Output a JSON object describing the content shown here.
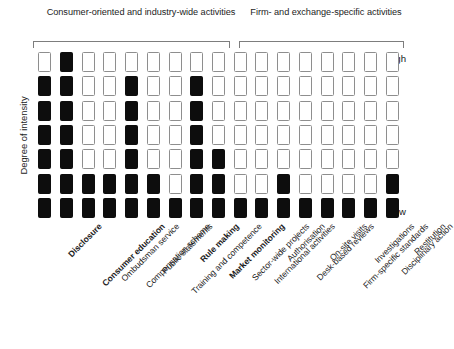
{
  "chart_data": {
    "type": "heatmap",
    "title": "",
    "xlabel": "",
    "ylabel": "Degree of intensity",
    "y_tick_labels": [
      "High",
      "Low"
    ],
    "ylim_labels": {
      "top": "High",
      "bottom": "Low"
    },
    "grid": false,
    "legend": "none",
    "rows": 7,
    "columns": 17,
    "cell_states": [
      "off",
      "on"
    ],
    "colors": {
      "on": "#0d0d0d",
      "off": "#ffffff",
      "cell_border": "#8e8e8e",
      "bracket": "#7d7d7d",
      "text": "#1d1d1d"
    },
    "groups": [
      {
        "label": "Consumer-oriented and industry-wide activities",
        "start_column": 1,
        "end_column": 10
      },
      {
        "label": "Firm- and exchange-specific activities",
        "start_column": 11,
        "end_column": 17
      }
    ],
    "categories": [
      "Disclosure",
      "Consumer education",
      "Ombudsman service",
      "Compensation scheme",
      "Public statements",
      "Training and competence",
      "Rule making",
      "Market monitoring",
      "Sector-wide projects",
      "International activities",
      "Authorisation",
      "Desk-based reviews",
      "On-site visits",
      "Firm-specific standards",
      "Investigations",
      "Disciplinary action",
      "Restitution"
    ],
    "emphasised_categories": [
      "Disclosure",
      "Consumer education",
      "Rule making",
      "Market monitoring"
    ],
    "intensity_values": [
      1,
      7,
      2,
      2,
      6,
      2,
      2,
      6,
      3,
      1,
      1,
      2,
      1,
      1,
      1,
      1,
      2
    ],
    "series": [
      {
        "name": "Level 7 (High)",
        "row_index": 0,
        "values": [
          0,
          1,
          0,
          0,
          0,
          0,
          0,
          0,
          0,
          0,
          0,
          0,
          0,
          0,
          0,
          0,
          0
        ]
      },
      {
        "name": "Level 6",
        "row_index": 1,
        "values": [
          1,
          1,
          0,
          0,
          1,
          0,
          0,
          1,
          0,
          0,
          0,
          0,
          0,
          0,
          0,
          0,
          0
        ]
      },
      {
        "name": "Level 5",
        "row_index": 2,
        "values": [
          1,
          1,
          0,
          0,
          1,
          0,
          0,
          1,
          0,
          0,
          0,
          0,
          0,
          0,
          0,
          0,
          0
        ]
      },
      {
        "name": "Level 4",
        "row_index": 3,
        "values": [
          1,
          1,
          0,
          0,
          1,
          0,
          0,
          1,
          0,
          0,
          0,
          0,
          0,
          0,
          0,
          0,
          0
        ]
      },
      {
        "name": "Level 3",
        "row_index": 4,
        "values": [
          1,
          1,
          0,
          0,
          1,
          0,
          0,
          1,
          1,
          0,
          0,
          0,
          0,
          0,
          0,
          0,
          0
        ]
      },
      {
        "name": "Level 2",
        "row_index": 5,
        "values": [
          1,
          1,
          1,
          1,
          1,
          1,
          0,
          1,
          1,
          0,
          0,
          1,
          0,
          0,
          0,
          0,
          1
        ]
      },
      {
        "name": "Level 1 (Low)",
        "row_index": 6,
        "values": [
          1,
          1,
          1,
          1,
          1,
          1,
          1,
          1,
          1,
          1,
          1,
          1,
          1,
          1,
          1,
          1,
          1
        ]
      }
    ]
  }
}
